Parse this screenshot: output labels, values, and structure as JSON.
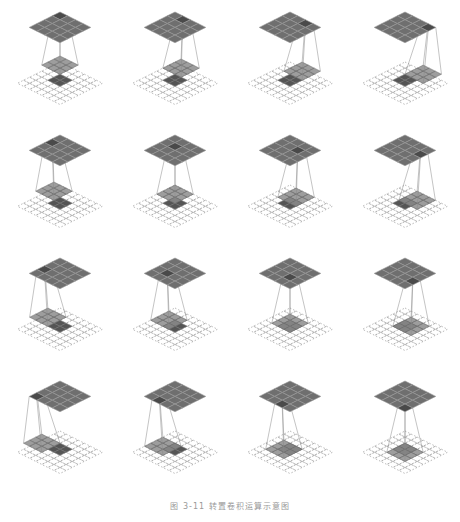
{
  "figure": {
    "caption": "图 3-11 转置卷积运算示意图",
    "rows": 4,
    "cols": 4,
    "colors": {
      "output_cell": "#6f6f6f",
      "output_cell_active": "#4a4a4a",
      "kernel_cell": "#8c8c8c",
      "input_cell": "#555555",
      "dashed_grid": "#9a9a9a",
      "connector": "#888888"
    }
  },
  "panels": [
    {
      "step": 1,
      "out": [
        0,
        0
      ]
    },
    {
      "step": 2,
      "out": [
        0,
        1
      ]
    },
    {
      "step": 3,
      "out": [
        0,
        2
      ]
    },
    {
      "step": 4,
      "out": [
        0,
        3
      ]
    },
    {
      "step": 5,
      "out": [
        1,
        0
      ]
    },
    {
      "step": 6,
      "out": [
        1,
        1
      ]
    },
    {
      "step": 7,
      "out": [
        1,
        2
      ]
    },
    {
      "step": 8,
      "out": [
        1,
        3
      ]
    },
    {
      "step": 9,
      "out": [
        2,
        0
      ]
    },
    {
      "step": 10,
      "out": [
        2,
        1
      ]
    },
    {
      "step": 11,
      "out": [
        2,
        2
      ]
    },
    {
      "step": 12,
      "out": [
        2,
        3
      ]
    },
    {
      "step": 13,
      "out": [
        3,
        0
      ]
    },
    {
      "step": 14,
      "out": [
        3,
        1
      ]
    },
    {
      "step": 15,
      "out": [
        3,
        2
      ]
    },
    {
      "step": 16,
      "out": [
        3,
        3
      ]
    }
  ]
}
